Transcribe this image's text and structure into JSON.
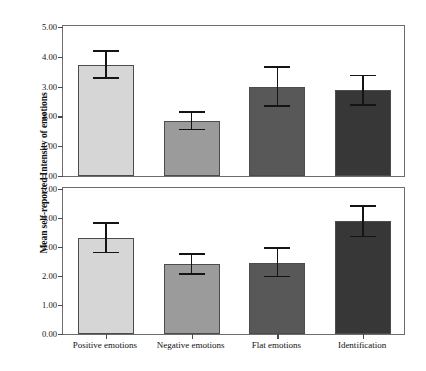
{
  "chart_data": {
    "type": "bar",
    "title": "",
    "subtitle": "",
    "xlabel": "",
    "ylabel": "Mean self-reported Intensity of emotions",
    "categories": [
      "Positive emotions",
      "Negative emotions",
      "Flat emotions",
      "Identification"
    ],
    "ylim": [
      0.0,
      5.0
    ],
    "ytick_labels": [
      "0.00",
      "1.00",
      "2.00",
      "3.00",
      "4.00",
      "5.00"
    ],
    "ytick_values": [
      0.0,
      1.0,
      2.0,
      3.0,
      4.0,
      5.0
    ],
    "grid": false,
    "legend": "none",
    "error_bar_type": "95% CI",
    "panels": [
      {
        "name": "top-panel",
        "ylim": [
          0.0,
          5.0
        ],
        "values": [
          3.72,
          1.85,
          3.0,
          2.9
        ],
        "err_low": [
          3.25,
          1.53,
          2.32,
          2.35
        ],
        "err_high": [
          4.22,
          2.17,
          3.7,
          3.4
        ],
        "colors": [
          "#d6d6d6",
          "#9b9b9b",
          "#585858",
          "#373737"
        ]
      },
      {
        "name": "bottom-panel",
        "ylim": [
          0.0,
          5.0
        ],
        "values": [
          3.3,
          2.4,
          2.45,
          3.88
        ],
        "err_low": [
          2.78,
          2.05,
          1.95,
          3.33
        ],
        "err_high": [
          3.87,
          2.78,
          3.0,
          4.45
        ],
        "colors": [
          "#d6d6d6",
          "#9b9b9b",
          "#585858",
          "#373737"
        ]
      }
    ]
  },
  "figure": {
    "background_color": "#ffffff",
    "frame_color": "#6d6d6d",
    "error_bar_color": "#141414",
    "tick_color": "#4a4a4a"
  }
}
